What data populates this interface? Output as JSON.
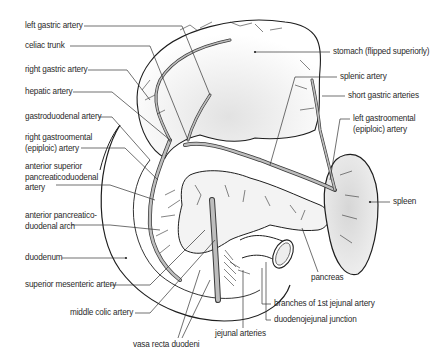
{
  "diagram": {
    "labels_left": [
      {
        "id": "left-gastric-artery",
        "text": "left gastric artery",
        "x": 25,
        "y": 24
      },
      {
        "id": "celiac-trunk",
        "text": "celiac trunk",
        "x": 25,
        "y": 44
      },
      {
        "id": "right-gastric-artery",
        "text": "right gastric artery",
        "x": 25,
        "y": 68
      },
      {
        "id": "hepatic-artery",
        "text": "hepatic artery",
        "x": 25,
        "y": 90
      },
      {
        "id": "gastroduodenal-artery",
        "text": "gastroduodenal artery",
        "x": 25,
        "y": 115
      },
      {
        "id": "right-gastroomental-artery",
        "text": "right gastroomental\n(epiploic) artery",
        "x": 25,
        "y": 141
      },
      {
        "id": "anterior-superior-pancreaticoduodenal-artery",
        "text": "anterior superior\npancreaticoduodenal\nartery",
        "x": 25,
        "y": 171
      },
      {
        "id": "anterior-pancreaticoduodenal-arch",
        "text": "anterior pancreatico-\nduodenal arch",
        "x": 25,
        "y": 218
      },
      {
        "id": "duodenum",
        "text": "duodenum",
        "x": 25,
        "y": 256
      },
      {
        "id": "superior-mesenteric-artery",
        "text": "superior mesenteric artery",
        "x": 25,
        "y": 283
      },
      {
        "id": "middle-colic-artery",
        "text": "middle colic artery",
        "x": 70,
        "y": 311
      }
    ],
    "labels_bottom": [
      {
        "id": "vasa-recta-duodeni",
        "text": "vasa recta duodeni",
        "x": 133,
        "y": 341
      },
      {
        "id": "jejunal-arteries",
        "text": "jejunal arteries",
        "x": 215,
        "y": 331
      }
    ],
    "labels_right": [
      {
        "id": "stomach",
        "text": "stomach (flipped superiorly)",
        "x": 333,
        "y": 50
      },
      {
        "id": "splenic-artery",
        "text": "splenic artery",
        "x": 340,
        "y": 75
      },
      {
        "id": "short-gastric-arteries",
        "text": "short gastric arteries",
        "x": 348,
        "y": 94
      },
      {
        "id": "left-gastroomental-artery",
        "text": "left gastroomental\n(epiploic) artery",
        "x": 353,
        "y": 117
      },
      {
        "id": "spleen",
        "text": "spleen",
        "x": 393,
        "y": 200
      },
      {
        "id": "pancreas",
        "text": "pancreas",
        "x": 311,
        "y": 276
      },
      {
        "id": "branches-1st-jejunal-artery",
        "text": "branches of 1st jejunal artery",
        "x": 274,
        "y": 302
      },
      {
        "id": "duodenojejunal-junction",
        "text": "duodenojejunal junction",
        "x": 274,
        "y": 318
      }
    ],
    "colors": {
      "outline": "#1e1e1e",
      "vessel_fill": "#bdbdbd",
      "vessel_edge": "#3a3a3a",
      "organ_shade": "#e6e6e6",
      "leader": "#333333",
      "text": "#2a2a2a"
    }
  }
}
